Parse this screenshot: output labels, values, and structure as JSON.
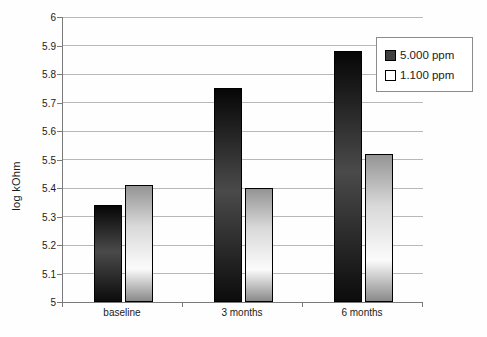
{
  "chart_data": {
    "type": "bar",
    "title": "",
    "xlabel": "",
    "ylabel": "log kOhm",
    "categories": [
      "baseline",
      "3 months",
      "6 months"
    ],
    "series": [
      {
        "name": "5.000 ppm",
        "values": [
          5.34,
          5.75,
          5.88
        ],
        "style": "dark-gradient"
      },
      {
        "name": "1.100 ppm",
        "values": [
          5.41,
          5.4,
          5.52
        ],
        "style": "light-gradient"
      }
    ],
    "ylim": [
      5,
      6
    ],
    "ytick_step": 0.1,
    "yticks": [
      6,
      5.9,
      5.8,
      5.7,
      5.6,
      5.5,
      5.4,
      5.3,
      5.2,
      5.1,
      5
    ],
    "ytick_labels": [
      "6",
      "5.9",
      "5.8",
      "5.7",
      "5.6",
      "5.5",
      "5.4",
      "5.3",
      "5.2",
      "5.1",
      "5"
    ],
    "grid": true,
    "legend_position": "top-right",
    "colors": {
      "dark_bar_gradient": [
        "#060606",
        "#4a4a4a",
        "#0c0c0c"
      ],
      "light_bar_gradient": [
        "#949494",
        "#d9d9d9",
        "#fbfbfb",
        "#8a8a8a"
      ],
      "bar_border": "#000000",
      "gridline": "#b8b8b8",
      "axis": "#7a7a7a",
      "text": "#1a1a1a",
      "legend_border": "#8c8c8c",
      "background": "#fefefe"
    }
  }
}
